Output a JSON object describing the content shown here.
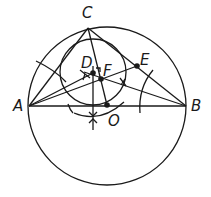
{
  "diagram": {
    "type": "geometric-construction",
    "stroke_color": "#1a1a1a",
    "background": "#ffffff",
    "points": {
      "A": {
        "label": "A",
        "x": 29,
        "y": 106
      },
      "B": {
        "label": "B",
        "x": 186,
        "y": 106
      },
      "C": {
        "label": "C",
        "x": 88,
        "y": 28
      },
      "D": {
        "label": "D",
        "x": 93,
        "y": 73
      },
      "E": {
        "label": "E",
        "x": 137,
        "y": 66
      },
      "F": {
        "label": "F",
        "x": 101,
        "y": 79
      },
      "O": {
        "label": "O",
        "x": 107,
        "y": 105
      }
    },
    "circumcircle": {
      "cx": 107,
      "cy": 106,
      "r": 79
    },
    "incircle": {
      "cx": 93,
      "cy": 72,
      "r": 33
    },
    "labels": {
      "A": "A",
      "B": "B",
      "C": "C",
      "D": "D",
      "E": "E",
      "F": "F",
      "O": "O"
    }
  }
}
